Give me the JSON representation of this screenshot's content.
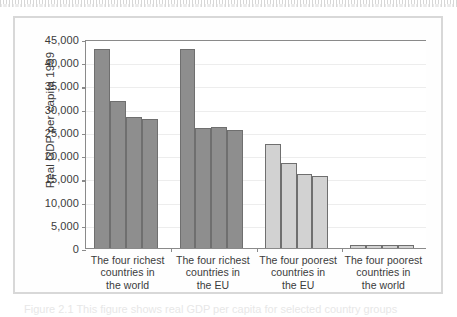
{
  "chart_data": {
    "type": "bar",
    "title": "",
    "xlabel": "",
    "ylabel": "Real GDP per capita 1999",
    "ylim": [
      0,
      45000
    ],
    "yticks": [
      "0",
      "5,000",
      "10,000",
      "15,000",
      "20,000",
      "25,000",
      "30,000",
      "35,000",
      "40,000",
      "45,000"
    ],
    "ytick_values": [
      0,
      5000,
      10000,
      15000,
      20000,
      25000,
      30000,
      35000,
      40000,
      45000
    ],
    "grid": true,
    "legend": "none",
    "categories": [
      "The four richest countries in the world",
      "The four richest countries in the EU",
      "The four poorest countries in the EU",
      "The four poorest countries in the world"
    ],
    "category_lines": [
      [
        "The four richest",
        "countries in",
        "the world"
      ],
      [
        "The four richest",
        "countries in",
        "the EU"
      ],
      [
        "The four poorest",
        "countries in",
        "the EU"
      ],
      [
        "The four poorest",
        "countries in",
        "the world"
      ]
    ],
    "groups": [
      {
        "label": "The four richest countries in the world",
        "color": "#8e8e8e",
        "values": [
          42800,
          31600,
          28300,
          27700
        ]
      },
      {
        "label": "The four richest countries in the EU",
        "color": "#8e8e8e",
        "values": [
          42800,
          25900,
          25950,
          25500
        ]
      },
      {
        "label": "The four poorest countries in the EU",
        "color": "#d2d2d2",
        "values": [
          22300,
          18200,
          16000,
          15500
        ]
      },
      {
        "label": "The four poorest countries in the world",
        "color": "#d2d2d2",
        "values": [
          700,
          650,
          600,
          560
        ]
      }
    ]
  },
  "colors": {
    "bar_dark": "#8e8e8e",
    "bar_light": "#d2d2d2",
    "bar_outline": "#6f6f6f",
    "axis": "#8a8a8a",
    "gridline": "#ededed",
    "text": "#3b3b3b",
    "frame": "#d8d8d8",
    "page_background": "#ffffff"
  },
  "caption": {
    "ghost_text": "Figure 2.1 This figure shows real GDP per capita for selected country groups"
  }
}
